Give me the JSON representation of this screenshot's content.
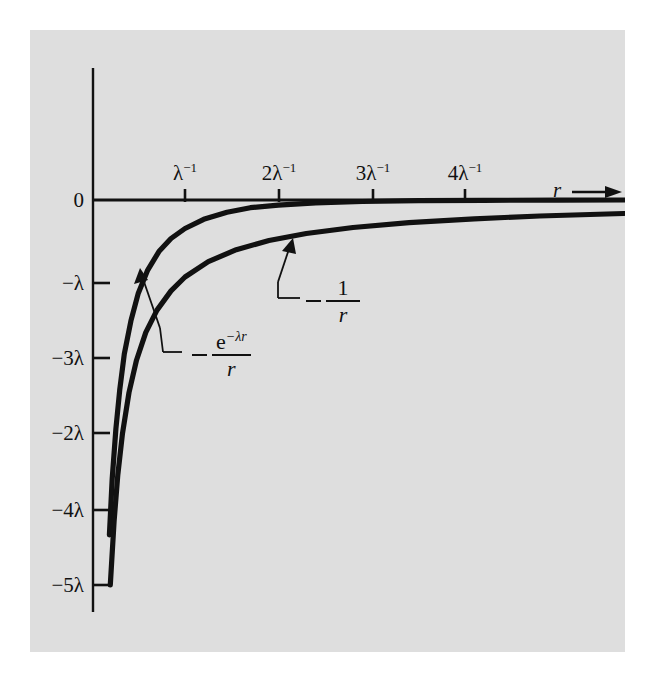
{
  "figure": {
    "background_color": "#dedede",
    "page_color": "#ffffff",
    "ink_color": "#111111"
  },
  "axes": {
    "x_axis_variable": "r",
    "arrow_icon": "right-arrow-icon",
    "origin_label": "0",
    "y_ticks": [
      {
        "label_prefix": "−",
        "label": "λ",
        "full": "−λ",
        "y": 283
      },
      {
        "label_prefix": "−",
        "label": "3λ",
        "full": "−3λ",
        "y": 358
      },
      {
        "label_prefix": "−",
        "label": "2λ",
        "full": "−2λ",
        "y": 433
      },
      {
        "label_prefix": "−",
        "label": "4λ",
        "full": "−4λ",
        "y": 510
      },
      {
        "label_prefix": "−",
        "label": "5λ",
        "full": "−5λ",
        "y": 585
      }
    ],
    "x_ticks": [
      {
        "base": "λ",
        "exponent": "−1",
        "full": "λ⁻¹",
        "x": 185
      },
      {
        "base": "2λ",
        "exponent": "−1",
        "full": "2λ⁻¹",
        "x": 279
      },
      {
        "base": "3λ",
        "exponent": "−1",
        "full": "3λ⁻¹",
        "x": 373
      },
      {
        "base": "4λ",
        "exponent": "−1",
        "full": "4λ⁻¹",
        "x": 465
      }
    ]
  },
  "annotations": {
    "coulomb": {
      "name": "coulomb-potential-label",
      "minus": "−",
      "numerator": "1",
      "denominator": "r",
      "full": "−1/r"
    },
    "yukawa": {
      "name": "yukawa-potential-label",
      "minus": "−",
      "numerator_base": "e",
      "numerator_exponent": "−λr",
      "denominator": "r",
      "full": "−e^{−λr}/r"
    }
  },
  "chart_data": {
    "type": "line",
    "title": "",
    "xlabel": "r",
    "ylabel": "",
    "xlim": [
      0,
      5.7
    ],
    "ylim": [
      -5.4,
      0.45
    ],
    "xtick_values": [
      1,
      2,
      3,
      4
    ],
    "xtick_labels": [
      "λ⁻¹",
      "2λ⁻¹",
      "3λ⁻¹",
      "4λ⁻¹"
    ],
    "ytick_values": [
      0,
      -1,
      -2,
      -3,
      -4,
      -5
    ],
    "ytick_labels": [
      "0",
      "−λ",
      "−3λ",
      "−2λ",
      "−4λ",
      "−5λ"
    ],
    "grid": false,
    "legend": "inline-annotations",
    "series": [
      {
        "name": "−e^{−λr}/r",
        "description": "Yukawa (screened) potential, decays fastest",
        "x": [
          0.19,
          0.22,
          0.26,
          0.3,
          0.35,
          0.42,
          0.5,
          0.6,
          0.72,
          0.85,
          1.0,
          1.2,
          1.45,
          1.7,
          2.0,
          2.4,
          2.9,
          3.5,
          4.2,
          5.0,
          5.7
        ],
        "y": [
          -4.35,
          -3.62,
          -2.97,
          -2.47,
          -2.0,
          -1.57,
          -1.21,
          -0.91,
          -0.67,
          -0.5,
          -0.37,
          -0.25,
          -0.16,
          -0.1,
          -0.068,
          -0.038,
          -0.019,
          -0.0086,
          -0.0036,
          -0.0013,
          -0.0005
        ]
      },
      {
        "name": "−1/r",
        "description": "Coulomb potential, long range tail",
        "x": [
          0.2,
          0.24,
          0.28,
          0.33,
          0.4,
          0.48,
          0.58,
          0.7,
          0.85,
          1.0,
          1.25,
          1.55,
          1.9,
          2.3,
          2.8,
          3.4,
          4.1,
          4.8,
          5.7
        ],
        "y": [
          -5.0,
          -4.17,
          -3.57,
          -3.03,
          -2.5,
          -2.08,
          -1.72,
          -1.43,
          -1.18,
          -1.0,
          -0.8,
          -0.645,
          -0.526,
          -0.435,
          -0.357,
          -0.294,
          -0.244,
          -0.208,
          -0.175
        ]
      }
    ]
  }
}
